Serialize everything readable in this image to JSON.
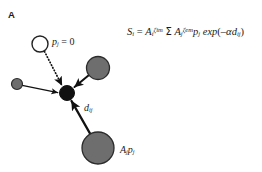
{
  "figure": {
    "panel_letter": "A",
    "background_color": "#ffffff",
    "width": 262,
    "height": 172
  },
  "colors": {
    "node_focal_fill": "#111111",
    "node_source_fill": "#6e6e6e",
    "node_outline": "#2b2b2b",
    "node_empty_fill": "#ffffff",
    "arrow": "#111111",
    "text": "#1a1a1a"
  },
  "formula": {
    "lhs_var": "S",
    "lhs_sub": "i",
    "equals": "=",
    "term_a_i": "A",
    "term_a_i_sub": "i",
    "term_a_i_sup": "ζim",
    "sum_symbol": "Σ",
    "term_a_j": "A",
    "term_a_j_sub": "j",
    "term_a_j_sup": "ζem",
    "term_p_j": "p",
    "term_p_j_sub": "j",
    "exp_fn": "exp",
    "exp_open": "(",
    "exp_minus": "–",
    "exp_alpha": "α",
    "exp_d": "d",
    "exp_d_sub": "ij",
    "exp_close": ")",
    "plain": "Sᵢ = Aᵢ^ζim Σ Aⱼ^ζem pⱼ exp(–αdᵢⱼ)"
  },
  "labels": {
    "empty_patch": {
      "var": "p",
      "sub": "j",
      "equals": "= 0",
      "plain": "pⱼ = 0"
    },
    "distance": {
      "var": "d",
      "sub": "ij",
      "plain": "dᵢⱼ"
    },
    "source_strength": {
      "var_a": "A",
      "sub_a": "j",
      "var_p": "p",
      "sub_p": "j",
      "plain": "Aⱼpⱼ"
    }
  },
  "nodes": [
    {
      "id": "empty-patch",
      "role": "empty source patch (p_j = 0)",
      "cx": 40,
      "cy": 44,
      "r": 8,
      "fill": "#ffffff",
      "stroke": "#222222"
    },
    {
      "id": "source-small-left",
      "role": "small source patch",
      "cx": 17,
      "cy": 84,
      "r": 5.5,
      "fill": "#6e6e6e",
      "stroke": "#2b2b2b"
    },
    {
      "id": "source-upper-right",
      "role": "medium source patch",
      "cx": 98,
      "cy": 68,
      "r": 11.5,
      "fill": "#6e6e6e",
      "stroke": "#2b2b2b"
    },
    {
      "id": "source-bottom",
      "role": "large source patch A_j p_j",
      "cx": 98,
      "cy": 148,
      "r": 16,
      "fill": "#6e6e6e",
      "stroke": "#2b2b2b"
    },
    {
      "id": "focal-patch",
      "role": "focal receiving patch i",
      "cx": 67,
      "cy": 93,
      "r": 7.5,
      "fill": "#111111",
      "stroke": "#111111"
    }
  ],
  "arrows": [
    {
      "id": "arrow-empty-to-focal",
      "from": "empty-patch",
      "to": "focal-patch",
      "style": "dotted",
      "width": 1.6
    },
    {
      "id": "arrow-smallleft-to-focal",
      "from": "source-small-left",
      "to": "focal-patch",
      "style": "solid",
      "width": 1.2
    },
    {
      "id": "arrow-upperright-to-focal",
      "from": "source-upper-right",
      "to": "focal-patch",
      "style": "solid",
      "width": 1.8
    },
    {
      "id": "arrow-bottom-to-focal",
      "from": "source-bottom",
      "to": "focal-patch",
      "style": "solid",
      "width": 2.2
    }
  ]
}
